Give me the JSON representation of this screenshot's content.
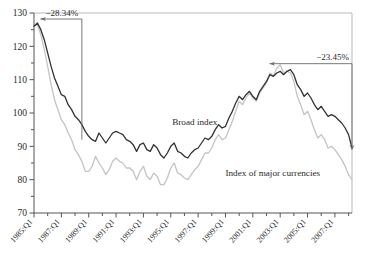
{
  "chart_data": {
    "type": "line",
    "title": "",
    "xlabel": "",
    "ylabel": "",
    "ylim": [
      70,
      130
    ],
    "xlim": [
      1985.0,
      2008.25
    ],
    "grid": false,
    "legend_position": "inline-annotations",
    "y_ticks": [
      70,
      80,
      90,
      100,
      110,
      120,
      130
    ],
    "y_minor_tick_step": 5,
    "x_tick_labels": [
      "1985:Q1",
      "1987:Q1",
      "1989:Q1",
      "1991:Q1",
      "1993:Q1",
      "1995:Q1",
      "1997:Q1",
      "1999:Q1",
      "2001:Q1",
      "2003:Q1",
      "2005:Q1",
      "2007:Q1"
    ],
    "x_tick_values": [
      1985,
      1987,
      1989,
      1991,
      1993,
      1995,
      1997,
      1999,
      2001,
      2003,
      2005,
      2007
    ],
    "annotations": [
      {
        "name": "decline-1985-1988",
        "text": "−28.34%",
        "x_start": 1985.25,
        "x_end": 1988.5,
        "y_value": 127.0
      },
      {
        "name": "decline-2002-2008",
        "text": "−23.45%",
        "x_start": 2002.0,
        "x_end": 2008.25,
        "y_value": 113.0
      }
    ],
    "series": [
      {
        "name": "Broad index",
        "label": "Broad index",
        "color": "#333333",
        "linewidth": 1.3,
        "label_x": 1995.1,
        "label_y": 96.5,
        "x": [
          1985.0,
          1985.25,
          1985.5,
          1985.75,
          1986.0,
          1986.25,
          1986.5,
          1986.75,
          1987.0,
          1987.25,
          1987.5,
          1987.75,
          1988.0,
          1988.25,
          1988.5,
          1988.75,
          1989.0,
          1989.25,
          1989.5,
          1989.75,
          1990.0,
          1990.25,
          1990.5,
          1990.75,
          1991.0,
          1991.25,
          1991.5,
          1991.75,
          1992.0,
          1992.25,
          1992.5,
          1992.75,
          1993.0,
          1993.25,
          1993.5,
          1993.75,
          1994.0,
          1994.25,
          1994.5,
          1994.75,
          1995.0,
          1995.25,
          1995.5,
          1995.75,
          1996.0,
          1996.25,
          1996.5,
          1996.75,
          1997.0,
          1997.25,
          1997.5,
          1997.75,
          1998.0,
          1998.25,
          1998.5,
          1998.75,
          1999.0,
          1999.25,
          1999.5,
          1999.75,
          2000.0,
          2000.25,
          2000.5,
          2000.75,
          2001.0,
          2001.25,
          2001.5,
          2001.75,
          2002.0,
          2002.25,
          2002.5,
          2002.75,
          2003.0,
          2003.25,
          2003.5,
          2003.75,
          2004.0,
          2004.25,
          2004.5,
          2004.75,
          2005.0,
          2005.25,
          2005.5,
          2005.75,
          2006.0,
          2006.25,
          2006.5,
          2006.75,
          2007.0,
          2007.25,
          2007.5,
          2007.75,
          2008.0,
          2008.25
        ],
        "values": [
          126.0,
          127.0,
          125.0,
          122.0,
          118.0,
          114.0,
          110.5,
          108.0,
          105.5,
          105.0,
          102.5,
          101.0,
          99.0,
          98.0,
          96.5,
          94.5,
          93.0,
          92.0,
          91.5,
          94.0,
          92.5,
          91.0,
          92.5,
          94.0,
          94.5,
          94.0,
          93.5,
          92.0,
          91.5,
          90.5,
          88.5,
          90.5,
          91.0,
          89.0,
          88.5,
          90.5,
          89.5,
          87.5,
          86.5,
          88.0,
          90.0,
          91.0,
          88.5,
          88.0,
          87.0,
          86.5,
          88.0,
          89.0,
          89.5,
          91.0,
          92.5,
          92.0,
          93.0,
          95.0,
          96.5,
          95.5,
          96.0,
          98.5,
          100.5,
          103.0,
          105.0,
          104.0,
          105.5,
          106.5,
          105.0,
          104.0,
          106.5,
          108.0,
          109.5,
          111.5,
          111.0,
          112.0,
          112.5,
          111.5,
          112.5,
          113.0,
          111.5,
          108.5,
          107.0,
          105.0,
          106.0,
          104.5,
          102.5,
          101.0,
          102.0,
          100.5,
          99.0,
          99.5,
          99.0,
          98.0,
          97.0,
          95.5,
          93.5,
          89.5
        ]
      },
      {
        "name": "Index of major currencies",
        "label": "Index of major currencies",
        "color": "#c4c4c4",
        "linewidth": 1.3,
        "label_x": 1999.0,
        "label_y": 81.0,
        "x": [
          1985.0,
          1985.25,
          1985.5,
          1985.75,
          1986.0,
          1986.25,
          1986.5,
          1986.75,
          1987.0,
          1987.25,
          1987.5,
          1987.75,
          1988.0,
          1988.25,
          1988.5,
          1988.75,
          1989.0,
          1989.25,
          1989.5,
          1989.75,
          1990.0,
          1990.25,
          1990.5,
          1990.75,
          1991.0,
          1991.25,
          1991.5,
          1991.75,
          1992.0,
          1992.25,
          1992.5,
          1992.75,
          1993.0,
          1993.25,
          1993.5,
          1993.75,
          1994.0,
          1994.25,
          1994.5,
          1994.75,
          1995.0,
          1995.25,
          1995.5,
          1995.75,
          1996.0,
          1996.25,
          1996.5,
          1996.75,
          1997.0,
          1997.25,
          1997.5,
          1997.75,
          1998.0,
          1998.25,
          1998.5,
          1998.75,
          1999.0,
          1999.25,
          1999.5,
          1999.75,
          2000.0,
          2000.25,
          2000.5,
          2000.75,
          2001.0,
          2001.25,
          2001.5,
          2001.75,
          2002.0,
          2002.25,
          2002.5,
          2002.75,
          2003.0,
          2003.25,
          2003.5,
          2003.75,
          2004.0,
          2004.25,
          2004.5,
          2004.75,
          2005.0,
          2005.25,
          2005.5,
          2005.75,
          2006.0,
          2006.25,
          2006.5,
          2006.75,
          2007.0,
          2007.25,
          2007.5,
          2007.75,
          2008.0,
          2008.25
        ],
        "values": [
          126.0,
          126.5,
          123.5,
          119.0,
          114.0,
          108.5,
          104.0,
          101.0,
          98.0,
          96.5,
          94.0,
          92.0,
          89.0,
          87.5,
          85.5,
          82.5,
          82.5,
          84.0,
          87.0,
          85.0,
          83.5,
          81.5,
          83.0,
          85.5,
          86.5,
          85.5,
          85.0,
          83.5,
          83.5,
          82.5,
          80.0,
          82.5,
          84.0,
          81.0,
          80.0,
          82.0,
          81.0,
          78.5,
          78.5,
          80.5,
          83.5,
          85.0,
          82.0,
          81.5,
          80.5,
          80.0,
          81.5,
          83.0,
          84.0,
          86.0,
          88.0,
          88.0,
          89.5,
          92.0,
          93.5,
          92.0,
          92.5,
          95.0,
          97.5,
          100.5,
          103.5,
          102.5,
          104.5,
          106.0,
          104.5,
          103.5,
          106.0,
          107.5,
          109.0,
          112.0,
          111.0,
          113.5,
          114.5,
          112.0,
          112.5,
          112.0,
          109.5,
          105.0,
          102.5,
          99.5,
          100.5,
          98.0,
          95.0,
          92.5,
          93.5,
          92.0,
          89.5,
          90.0,
          89.0,
          87.5,
          86.0,
          84.0,
          81.5,
          80.0
        ]
      }
    ]
  }
}
